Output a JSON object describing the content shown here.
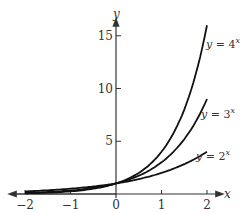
{
  "chart_data": {
    "type": "line",
    "title": "",
    "xlabel": "x",
    "ylabel": "y",
    "xlim": [
      -2,
      2
    ],
    "ylim": [
      0,
      16
    ],
    "x_ticks": [
      "-2",
      "-1",
      "0",
      "1",
      "2"
    ],
    "y_ticks": [
      "5",
      "10",
      "15"
    ],
    "series": [
      {
        "name": "y = 4^x",
        "label": "y = 4",
        "sup": "x",
        "base": 4,
        "x": [
          -2,
          -1,
          0,
          1,
          2
        ],
        "values": [
          0.0625,
          0.25,
          1,
          4,
          16
        ]
      },
      {
        "name": "y = 3^x",
        "label": "y = 3",
        "sup": "x",
        "base": 3,
        "x": [
          -2,
          -1,
          0,
          1,
          2
        ],
        "values": [
          0.111,
          0.333,
          1,
          3,
          9
        ]
      },
      {
        "name": "y = 2^x",
        "label": "y = 2",
        "sup": "x",
        "base": 2,
        "x": [
          -2,
          -1,
          0,
          1,
          2
        ],
        "values": [
          0.25,
          0.5,
          1,
          2,
          4
        ]
      }
    ],
    "grid": false,
    "legend": "inline labels at curve ends"
  }
}
